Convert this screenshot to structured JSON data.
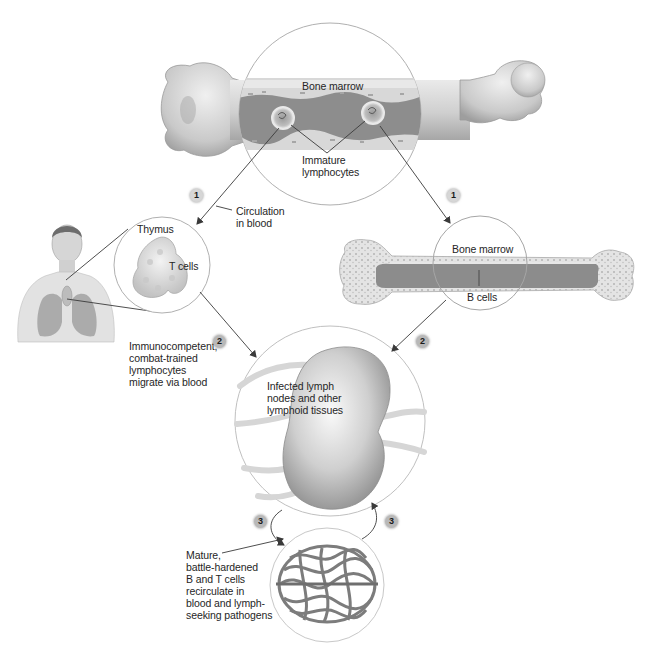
{
  "diagram": {
    "colors": {
      "background": "#ffffff",
      "bone": "#d9d9d9",
      "bone_shadow": "#a9a9a9",
      "marrow": "#8c8c8c",
      "outline": "#9a9a9a",
      "arrow": "#3a3a3a",
      "badge": "#b8b8b8"
    },
    "labels": {
      "bone_marrow_top": "Bone marrow",
      "immature_lymphocytes": [
        "Immature",
        "lymphocytes"
      ],
      "circulation": [
        "Circulation",
        "in blood"
      ],
      "thymus": "Thymus",
      "t_cells": "T cells",
      "bone_marrow_right": "Bone marrow",
      "b_cells": "B cells",
      "immunocompetent": [
        "Immunocompetent,",
        "combat-trained",
        "lymphocytes",
        "migrate via blood"
      ],
      "lymph_nodes": [
        "Infected lymph",
        "nodes and other",
        "lymphoid tissues"
      ],
      "mature": [
        "Mature,",
        "battle-hardened",
        "B and T cells",
        "recirculate in",
        "blood and lymph-",
        "seeking pathogens"
      ]
    },
    "steps": {
      "step1_left": "1",
      "step1_right": "1",
      "step2_left": "2",
      "step2_right": "2",
      "step3_left": "3",
      "step3_right": "3"
    }
  }
}
